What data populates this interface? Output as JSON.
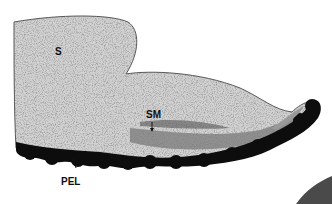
{
  "figure": {
    "type": "histology micrograph",
    "labels": {
      "stroma": "S",
      "smooth_muscle": "SM",
      "pigmented_epithelial_layer": "PEL"
    }
  }
}
